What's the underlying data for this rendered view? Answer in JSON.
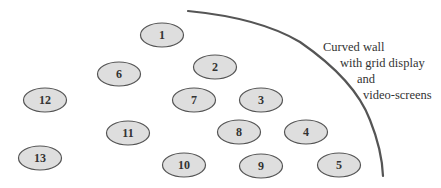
{
  "diagram": {
    "wall": {
      "label_lines": [
        "Curved wall",
        "with grid display",
        "and",
        "video-screens"
      ],
      "stroke_color": "#555555"
    },
    "seat_style": {
      "fill": "#dedede",
      "stroke": "#555555"
    },
    "seats": [
      {
        "id": "1",
        "label": "1",
        "cx": 162,
        "cy": 35
      },
      {
        "id": "2",
        "label": "2",
        "cx": 215,
        "cy": 67
      },
      {
        "id": "3",
        "label": "3",
        "cx": 261,
        "cy": 100
      },
      {
        "id": "4",
        "label": "4",
        "cx": 306,
        "cy": 132
      },
      {
        "id": "5",
        "label": "5",
        "cx": 339,
        "cy": 165
      },
      {
        "id": "6",
        "label": "6",
        "cx": 119,
        "cy": 74
      },
      {
        "id": "7",
        "label": "7",
        "cx": 194,
        "cy": 100
      },
      {
        "id": "8",
        "label": "8",
        "cx": 239,
        "cy": 132
      },
      {
        "id": "9",
        "label": "9",
        "cx": 261,
        "cy": 166
      },
      {
        "id": "10",
        "label": "10",
        "cx": 184,
        "cy": 165
      },
      {
        "id": "11",
        "label": "11",
        "cx": 128,
        "cy": 133
      },
      {
        "id": "12",
        "label": "12",
        "cx": 45,
        "cy": 100
      },
      {
        "id": "13",
        "label": "13",
        "cx": 40,
        "cy": 158
      }
    ]
  }
}
